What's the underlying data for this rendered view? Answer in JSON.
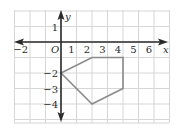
{
  "chart_data": {
    "type": "scatter",
    "title": "",
    "xlabel": "x",
    "ylabel": "y",
    "origin_label": "O",
    "xlim": [
      -3,
      7
    ],
    "ylim": [
      -5.2,
      2
    ],
    "grid": true,
    "x_ticks": [
      {
        "value": -2,
        "label": "−2"
      },
      {
        "value": 1,
        "label": "1"
      },
      {
        "value": 2,
        "label": "2"
      },
      {
        "value": 3,
        "label": "3"
      },
      {
        "value": 4,
        "label": "4"
      },
      {
        "value": 5,
        "label": "5"
      },
      {
        "value": 6,
        "label": "6"
      }
    ],
    "y_ticks": [
      {
        "value": 1,
        "label": "1"
      },
      {
        "value": -2,
        "label": "−2"
      },
      {
        "value": -3,
        "label": "−3"
      },
      {
        "value": -4,
        "label": "−4"
      }
    ],
    "shapes": [
      {
        "name": "pentagon",
        "kind": "polygon",
        "vertices": [
          [
            0,
            -2
          ],
          [
            2,
            -1
          ],
          [
            4,
            -1
          ],
          [
            4,
            -3
          ],
          [
            2,
            -4
          ]
        ],
        "stroke": "#8a8a8a"
      }
    ]
  },
  "colors": {
    "grid": "#d6d6d6",
    "axis": "#2a2a2a",
    "shape": "#8a8a8a",
    "background": "#ffffff"
  },
  "labels": {
    "x_axis": "x",
    "y_axis": "y",
    "origin": "O"
  }
}
